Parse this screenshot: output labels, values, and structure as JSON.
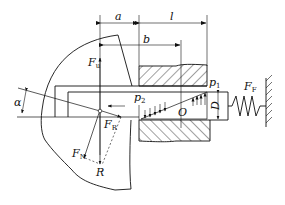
{
  "diagram": {
    "type": "mechanical force diagram (tool holder / plunger with spring)",
    "labels": {
      "a": "a",
      "l": "l",
      "b": "b",
      "Fu_main": "F",
      "Fu_sub": "u",
      "p1_main": "p",
      "p1_sub": "1",
      "p2_main": "p",
      "p2_sub": "2",
      "FF_main": "F",
      "FF_sub": "F",
      "D": "D",
      "O": "O",
      "alpha": "α",
      "FR_main": "F",
      "FR_sub": "R",
      "FN_main": "F",
      "FN_sub": "N",
      "R": "R"
    },
    "colors": {
      "line": "#111111",
      "background": "#ffffff"
    }
  }
}
